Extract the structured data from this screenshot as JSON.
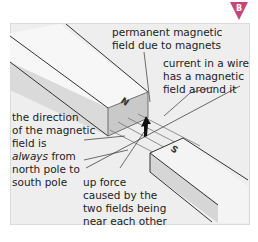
{
  "badge": {
    "letter": "B",
    "color": "#c8457e"
  },
  "diagram": {
    "magnet_north_label": "N",
    "magnet_south_label": "S",
    "labels": {
      "permanent_field_1": "permanent magnetic",
      "permanent_field_2": "field due to magnets",
      "wire_field_1": "current in a wire",
      "wire_field_2": "has a magnetic",
      "wire_field_3": "field around it",
      "direction_1": "the direction",
      "direction_2": "of the magnetic",
      "direction_3": "field  is",
      "direction_4_em": "always",
      "direction_4_rest": " from",
      "direction_5": "north pole to",
      "direction_6": "south pole",
      "force_1": "up force",
      "force_2": "caused by the",
      "force_3": "two fields being",
      "force_4": "near each other"
    }
  }
}
